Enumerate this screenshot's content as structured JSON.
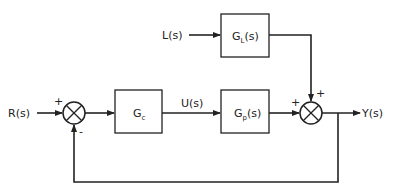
{
  "diagram": {
    "type": "feedforward-feedback control block diagram",
    "inputs": {
      "reference": "R(s)",
      "load": "L(s)"
    },
    "output": "Y(s)",
    "signals": {
      "controller_output": "U(s)"
    },
    "blocks": {
      "controller": {
        "main": "G",
        "subscript": "c",
        "suffix": ""
      },
      "process": {
        "main": "G",
        "subscript": "p",
        "suffix": "(s)"
      },
      "load": {
        "main": "G",
        "subscript": "L",
        "suffix": "(s)"
      }
    },
    "summing_junctions": {
      "error": {
        "signs": {
          "reference": "+",
          "feedback": "-"
        }
      },
      "output": {
        "signs": {
          "process": "+",
          "load": "+"
        }
      }
    },
    "colors": {
      "line": "#222222",
      "background": "#ffffff"
    }
  }
}
